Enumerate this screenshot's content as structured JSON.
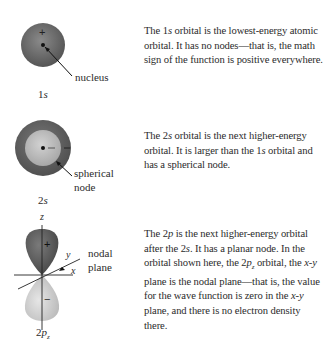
{
  "orbitals": [
    {
      "id": "1s",
      "label_num": "1",
      "label_letter": "s",
      "callout": "nucleus",
      "sign": "+",
      "description_parts": [
        "The ",
        "1",
        "s",
        " orbital is the lowest-energy atomic orbital. It has no nodes—that is, the math sign of the function is positive everywhere."
      ]
    },
    {
      "id": "2s",
      "label_num": "2",
      "label_letter": "s",
      "callout_line1": "spherical",
      "callout_line2": "node",
      "description_parts": [
        "The ",
        "2",
        "s",
        " orbital is the next higher-energy orbital. It is larger than the ",
        "1",
        "s",
        " orbital and has a spherical node."
      ]
    },
    {
      "id": "2pz",
      "label_num": "2",
      "label_letter": "p",
      "label_sub": "z",
      "callout_line1": "nodal",
      "callout_line2": "plane",
      "sign_top": "+",
      "sign_bottom": "−",
      "axis_x": "x",
      "axis_y": "y",
      "axis_z": "z",
      "description_parts": [
        "The ",
        "2",
        "p",
        " is the next higher-energy orbital after the ",
        "2",
        "s",
        ". It has a planar node. In the orbital shown here, the ",
        "2",
        "p",
        "z",
        " orbital, the ",
        "x",
        "-",
        "y",
        " plane is the nodal plane—that is, the value for the wave function is zero in the ",
        "x",
        "-",
        "y",
        " plane, and there is no electron density there."
      ]
    }
  ],
  "colors": {
    "lobe_dark": "#6a6a6a",
    "lobe_light": "#c8c8c8",
    "text": "#2b2b2b"
  }
}
